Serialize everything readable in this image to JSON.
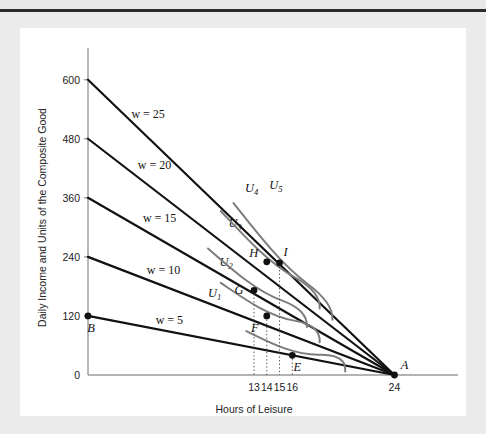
{
  "figure": {
    "background_color": "#ffffff",
    "page_color": "#ebebeb",
    "rule_color": "#2b2b2b"
  },
  "chart_data": {
    "type": "line",
    "title": "",
    "xlabel": "Hours of Leisure",
    "ylabel": "Daily Income and Units of the Composite Good",
    "xlim": [
      0,
      26
    ],
    "ylim": [
      0,
      640
    ],
    "grid": false,
    "legend_position": "inline-labels",
    "x_ticks": [
      {
        "value": 13,
        "label": "13"
      },
      {
        "value": 14,
        "label": "14"
      },
      {
        "value": 15,
        "label": "15"
      },
      {
        "value": 16,
        "label": "16"
      },
      {
        "value": 24,
        "label": "24"
      }
    ],
    "y_ticks": [
      {
        "value": 0,
        "label": "0"
      },
      {
        "value": 120,
        "label": "120"
      },
      {
        "value": 240,
        "label": "240"
      },
      {
        "value": 360,
        "label": "360"
      },
      {
        "value": 480,
        "label": "480"
      },
      {
        "value": 600,
        "label": "600"
      }
    ],
    "budget_lines": [
      {
        "name": "w5",
        "label": "w = 5",
        "wage": 5,
        "intercept": 120,
        "endpoint_x": 24,
        "endpoint_y": 0,
        "label_x": 5.3,
        "label_y": 104,
        "color": "#111111"
      },
      {
        "name": "w10",
        "label": "w = 10",
        "wage": 10,
        "intercept": 240,
        "endpoint_x": 24,
        "endpoint_y": 0,
        "label_x": 4.6,
        "label_y": 206,
        "color": "#111111"
      },
      {
        "name": "w15",
        "label": "w = 15",
        "wage": 15,
        "intercept": 360,
        "endpoint_x": 24,
        "endpoint_y": 0,
        "label_x": 4.3,
        "label_y": 310,
        "color": "#111111"
      },
      {
        "name": "w20",
        "label": "w = 20",
        "wage": 20,
        "intercept": 480,
        "endpoint_x": 24,
        "endpoint_y": 0,
        "label_x": 3.9,
        "label_y": 418,
        "color": "#111111"
      },
      {
        "name": "w25",
        "label": "w = 25",
        "wage": 25,
        "intercept": 600,
        "endpoint_x": 24,
        "endpoint_y": 0,
        "label_x": 3.4,
        "label_y": 522,
        "color": "#111111"
      }
    ],
    "indifference_curves": [
      {
        "name": "U1",
        "label": "U",
        "subscript": "1",
        "label_x": 9.4,
        "label_y": 158,
        "color": "#7d7d7d"
      },
      {
        "name": "U2",
        "label": "U",
        "subscript": "2",
        "label_x": 10.3,
        "label_y": 222,
        "color": "#7d7d7d"
      },
      {
        "name": "U3",
        "label": "U",
        "subscript": "3",
        "label_x": 11.0,
        "label_y": 300,
        "color": "#7d7d7d"
      },
      {
        "name": "U4",
        "label": "U",
        "subscript": "4",
        "label_x": 12.3,
        "label_y": 372,
        "color": "#7d7d7d"
      },
      {
        "name": "U5",
        "label": "U",
        "subscript": "5",
        "label_x": 14.2,
        "label_y": 378,
        "color": "#7d7d7d"
      }
    ],
    "points": [
      {
        "name": "A",
        "label": "A",
        "x": 24,
        "y": 0,
        "label_dx": 10,
        "label_dy": -6,
        "drop_line": false
      },
      {
        "name": "B",
        "label": "B",
        "x": 0,
        "y": 120,
        "label_dx": 3,
        "label_dy": 16,
        "drop_line": false
      },
      {
        "name": "E",
        "label": "E",
        "x": 16,
        "y": 40,
        "label_dx": 5,
        "label_dy": 16,
        "drop_line": true
      },
      {
        "name": "F",
        "label": "F",
        "x": 14,
        "y": 120,
        "label_dx": -12,
        "label_dy": 16,
        "drop_line": true
      },
      {
        "name": "G",
        "label": "G",
        "x": 13,
        "y": 172,
        "label_dx": -15,
        "label_dy": 4,
        "drop_line": true
      },
      {
        "name": "H",
        "label": "H",
        "x": 14,
        "y": 230,
        "label_dx": -13,
        "label_dy": -5,
        "drop_line": false
      },
      {
        "name": "I",
        "label": "I",
        "x": 15,
        "y": 228,
        "label_dx": 6,
        "label_dy": -7,
        "drop_line": true
      }
    ]
  }
}
